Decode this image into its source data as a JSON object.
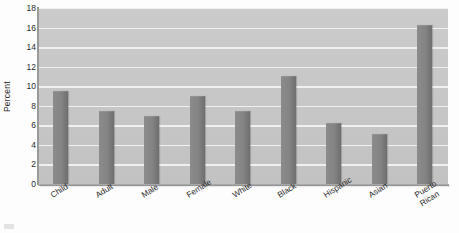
{
  "chart_data": {
    "type": "bar",
    "title": "",
    "xlabel": "",
    "ylabel": "Percent",
    "ylim": [
      0,
      18
    ],
    "ytick_step": 2,
    "yticks": [
      18,
      16,
      14,
      12,
      10,
      8,
      6,
      4,
      2,
      0
    ],
    "grid": true,
    "legend": "none",
    "categories": [
      "Child",
      "Adult",
      "Male",
      "Female",
      "White",
      "Black",
      "Hispanic",
      "Asian",
      "Puerto\nRican"
    ],
    "values": [
      9.5,
      7.5,
      7.0,
      9.0,
      7.5,
      11.0,
      6.2,
      5.1,
      16.3
    ],
    "bars": [
      {
        "label": "Child",
        "value": 9.5
      },
      {
        "label": "Adult",
        "value": 7.5
      },
      {
        "label": "Male",
        "value": 7.0
      },
      {
        "label": "Female",
        "value": 9.0
      },
      {
        "label": "White",
        "value": 7.5
      },
      {
        "label": "Black",
        "value": 11.0
      },
      {
        "label": "Hispanic",
        "value": 6.2
      },
      {
        "label": "Asian",
        "value": 5.1
      },
      {
        "label": "Puerto Rican",
        "value": 16.3
      }
    ]
  },
  "style": {
    "plot_background": "#c7c7c7",
    "gridline_color": "#f2f2f2",
    "bar_color": "#878787",
    "bar_shadow_color": "#6e6e6e",
    "text_color": "#2b2b2b",
    "page_background": "#fdfdfd"
  }
}
